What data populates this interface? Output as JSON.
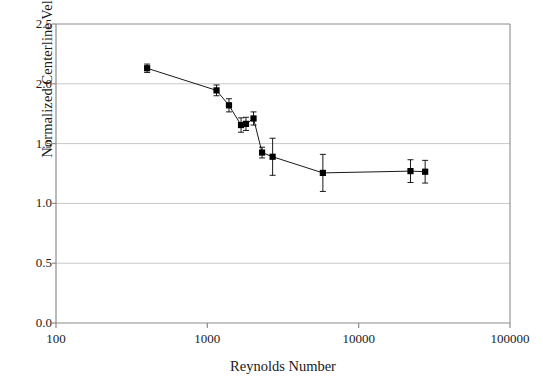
{
  "chart_data": {
    "type": "scatter",
    "title": "",
    "xlabel": "Reynolds Number",
    "ylabel_plain": "Normalized Centerline Velocity, Uc/Uavg",
    "ylabel_parts": {
      "prefix": "Normalized Centerline Velocity, ",
      "num_var": "U",
      "num_sub": "c",
      "slash": "/",
      "den_var": "U",
      "den_sub": "avg"
    },
    "xscale": "log",
    "yscale": "linear",
    "xlim": [
      100,
      100000
    ],
    "ylim": [
      0.0,
      2.5
    ],
    "xticks": [
      100,
      1000,
      10000,
      100000
    ],
    "xtick_labels": [
      "100",
      "1000",
      "10000",
      "100000"
    ],
    "yticks": [
      0.0,
      0.5,
      1.0,
      1.5,
      2.0,
      2.5
    ],
    "ytick_labels": [
      "0.0",
      "0.5",
      "1.0",
      "1.5",
      "2.0",
      "2.5"
    ],
    "grid": "horizontal",
    "grid_color": "#c8c8c8",
    "legend": "none",
    "marker": "filled-square",
    "marker_color": "#000000",
    "line_color": "#000000",
    "series": [
      {
        "name": "Normalized centerline velocity",
        "points": [
          {
            "x": 400,
            "y": 2.13,
            "yerr": 0.035
          },
          {
            "x": 1150,
            "y": 1.945,
            "yerr": 0.045
          },
          {
            "x": 1390,
            "y": 1.82,
            "yerr": 0.055
          },
          {
            "x": 1670,
            "y": 1.655,
            "yerr": 0.06
          },
          {
            "x": 1800,
            "y": 1.665,
            "yerr": 0.055
          },
          {
            "x": 2020,
            "y": 1.71,
            "yerr": 0.055
          },
          {
            "x": 2300,
            "y": 1.425,
            "yerr": 0.045
          },
          {
            "x": 2700,
            "y": 1.39,
            "yerr": 0.155
          },
          {
            "x": 5800,
            "y": 1.255,
            "yerr": 0.155
          },
          {
            "x": 22000,
            "y": 1.27,
            "yerr": 0.095
          },
          {
            "x": 27500,
            "y": 1.265,
            "yerr": 0.095
          }
        ]
      }
    ]
  },
  "axes": {
    "plot_left_px": 56,
    "plot_right_px": 510,
    "plot_top_px": 24,
    "plot_bottom_px": 323
  }
}
